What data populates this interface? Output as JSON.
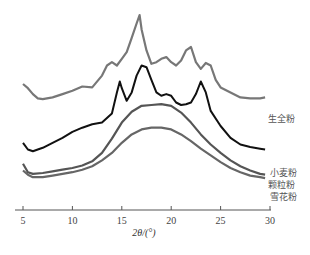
{
  "chart_data": {
    "type": "line",
    "title": "",
    "xlabel": "2θ/(°)",
    "ylabel": "",
    "xlim": [
      5,
      30
    ],
    "x_ticks": [
      "5",
      "10",
      "15",
      "20",
      "25",
      "30"
    ],
    "grid": false,
    "legend_position": "inline-right",
    "y_units": "relative intensity (no y-axis shown; values are relative heights, higher = more intense)",
    "series": [
      {
        "name": "生全粉",
        "color": "#777777",
        "x": [
          5,
          5.5,
          6,
          6.5,
          7,
          8,
          9,
          10,
          11,
          12,
          13,
          13.5,
          14,
          14.5,
          15,
          15.5,
          16,
          16.5,
          16.8,
          17,
          17.5,
          18,
          18.5,
          19,
          19.5,
          20,
          20.5,
          21,
          21.5,
          22,
          22.5,
          23,
          23.5,
          24,
          24.5,
          25,
          26,
          27,
          28,
          29,
          29.5
        ],
        "values": [
          150,
          145,
          138,
          133,
          132,
          134,
          138,
          142,
          147,
          146,
          160,
          172,
          176,
          172,
          180,
          188,
          205,
          222,
          232,
          215,
          190,
          174,
          176,
          180,
          182,
          176,
          172,
          178,
          190,
          194,
          176,
          168,
          175,
          172,
          155,
          146,
          140,
          134,
          133,
          133,
          134
        ]
      },
      {
        "name": "小麦粉",
        "color": "#111111",
        "x": [
          5,
          5.5,
          6,
          6.5,
          7,
          8,
          9,
          10,
          11,
          12,
          13,
          14,
          14.5,
          14.8,
          15,
          15.5,
          16,
          16.5,
          17,
          17.5,
          18,
          18.5,
          19,
          19.5,
          20,
          20.5,
          21,
          21.5,
          22,
          22.5,
          23,
          23.5,
          24,
          25,
          26,
          27,
          28,
          29,
          29.5
        ],
        "values": [
          80,
          72,
          70,
          72,
          74,
          80,
          86,
          93,
          98,
          102,
          104,
          115,
          140,
          153,
          145,
          130,
          140,
          160,
          172,
          170,
          155,
          140,
          136,
          138,
          136,
          128,
          125,
          126,
          128,
          138,
          153,
          140,
          118,
          100,
          86,
          78,
          75,
          73,
          72
        ]
      },
      {
        "name": "颗粒粉",
        "color": "#555555",
        "x": [
          5,
          5.5,
          6,
          7,
          8,
          9,
          10,
          11,
          12,
          13,
          14,
          15,
          16,
          17,
          18,
          19,
          20,
          21,
          22,
          23,
          24,
          25,
          26,
          27,
          28,
          29,
          29.5
        ],
        "values": [
          55,
          45,
          43,
          44,
          46,
          48,
          50,
          53,
          58,
          68,
          85,
          104,
          117,
          124,
          125,
          126,
          124,
          116,
          104,
          90,
          78,
          68,
          59,
          52,
          47,
          43,
          42
        ]
      },
      {
        "name": "雪花粉",
        "color": "#666666",
        "x": [
          5,
          5.5,
          6,
          7,
          8,
          9,
          10,
          11,
          12,
          13,
          14,
          15,
          16,
          17,
          18,
          19,
          20,
          21,
          22,
          23,
          24,
          25,
          26,
          27,
          28,
          29,
          29.5
        ],
        "values": [
          47,
          42,
          39,
          39,
          41,
          43,
          45,
          48,
          52,
          59,
          68,
          80,
          90,
          96,
          98,
          98,
          96,
          90,
          82,
          73,
          65,
          57,
          50,
          45,
          41,
          39,
          38
        ]
      }
    ]
  },
  "labels": {
    "series_0": "生全粉",
    "series_1": "小麦粉",
    "series_2": "颗粒粉",
    "series_3": "雪花粉",
    "xaxis_title": "2θ/(°)",
    "ticks": [
      "5",
      "10",
      "15",
      "20",
      "25",
      "30"
    ]
  }
}
